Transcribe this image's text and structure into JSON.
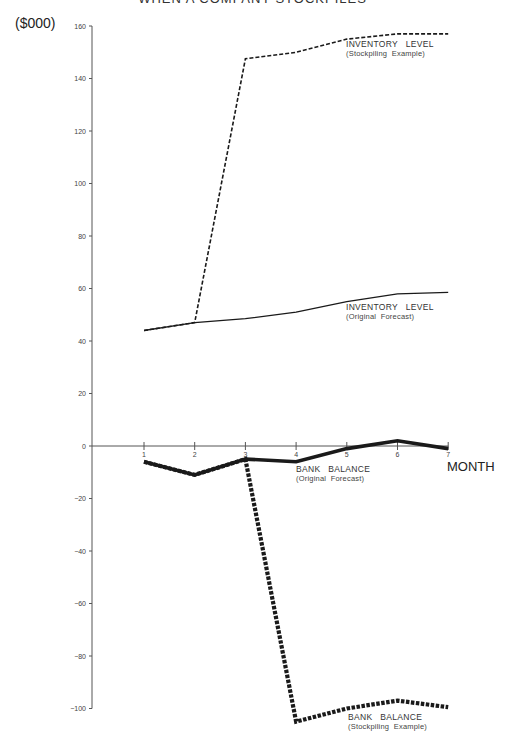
{
  "chart_data": {
    "type": "line",
    "title": "WHEN A COMPANY STOCKPILES",
    "ylabel": "($000)",
    "xlabel": "MONTH",
    "x": [
      1,
      2,
      3,
      4,
      5,
      6,
      7
    ],
    "ylim": [
      -100,
      160
    ],
    "yticks": [
      160,
      140,
      120,
      100,
      80,
      60,
      40,
      20,
      0,
      -20,
      -40,
      -60,
      -80,
      -100
    ],
    "grid": false,
    "legend": "inline labels",
    "series": [
      {
        "name": "INVENTORY LEVEL (Stockpiling Example)",
        "label": "INVENTORY   LEVEL",
        "sublabel": "(Stockpiling  Example)",
        "style": "dashed-thin",
        "values": [
          44,
          47,
          147.5,
          150,
          155,
          157,
          157
        ]
      },
      {
        "name": "INVENTORY LEVEL (Original Forecast)",
        "label": "INVENTORY   LEVEL",
        "sublabel": "(Original  Forecast)",
        "style": "solid-thin",
        "values": [
          44,
          47,
          48.5,
          51,
          55,
          58,
          58.5
        ]
      },
      {
        "name": "BANK BALANCE (Original Forecast)",
        "label": "BANK   BALANCE",
        "sublabel": "(Original  Forecast)",
        "style": "solid-thick",
        "values": [
          -6,
          -11,
          -5,
          -6,
          -1,
          2,
          -1
        ]
      },
      {
        "name": "BANK BALANCE (Stockpiling Example)",
        "label": "BANK   BALANCE",
        "sublabel": "(Stockpiling  Example)",
        "style": "dashed-thick",
        "values": [
          -6,
          -11,
          -5,
          -105,
          -100,
          -97,
          -99.5
        ]
      }
    ]
  },
  "colors": {
    "line": "#1a1a1a",
    "axis": "#555555"
  }
}
